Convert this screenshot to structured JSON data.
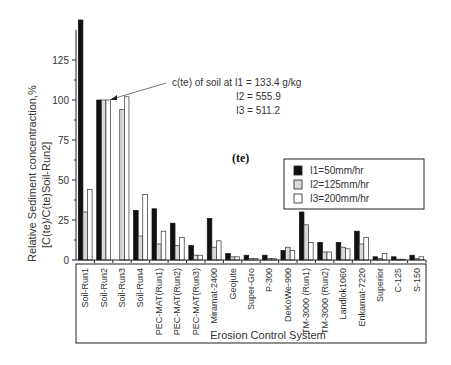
{
  "chart_data": {
    "type": "bar",
    "title": "",
    "panel_label": "(te)",
    "xlabel": "Erosion Control System",
    "ylabel_line1": "Relative Sediment concentraction,%",
    "ylabel_line2": "[C(te)/C(te)Soil-Run2]",
    "ylim": [
      0,
      150
    ],
    "yticks": [
      0,
      25,
      50,
      75,
      100,
      125
    ],
    "grid": false,
    "legend_position": "upper right (inside)",
    "categories": [
      "Soil-Run1",
      "Soil-Run2",
      "Soil-Run3",
      "Soil-Run4",
      "PEC-MAT(Run1)",
      "PEC-MAT(Run2)",
      "PEC-MAT(Run3)",
      "Miramat-2400",
      "Geojute",
      "Super-Gro",
      "P-300",
      "DeKoWe-900",
      "TM-3000 (Run1)",
      "TM-3000 (Run2)",
      "Landlok1060",
      "Enkamat-7220",
      "Superior",
      "C-125",
      "S-150"
    ],
    "series": [
      {
        "name": "I1=50mm/hr",
        "color": "#111111",
        "values": [
          160,
          100,
          0,
          31,
          32,
          23,
          9,
          26,
          4,
          3,
          3,
          6,
          30,
          11,
          11,
          18,
          2,
          2,
          3
        ]
      },
      {
        "name": "I2=125mm/hr",
        "color": "#d9d9d9",
        "values": [
          30,
          100,
          94,
          15,
          10,
          9,
          3,
          8,
          2,
          1,
          1,
          8,
          22,
          5,
          8,
          10,
          1,
          0.5,
          1
        ]
      },
      {
        "name": "I3=200mm/hr",
        "color": "#ffffff",
        "values": [
          44,
          100,
          102,
          41,
          18,
          14,
          3,
          12,
          2,
          1,
          1,
          6,
          11,
          5,
          7,
          14,
          4,
          0.5,
          2
        ]
      }
    ],
    "annotation": {
      "line1": "c(te) of soil at I1 = 133.4 g/kg",
      "line2": "I2 = 555.9",
      "line3": "I3 = 511.2"
    }
  }
}
